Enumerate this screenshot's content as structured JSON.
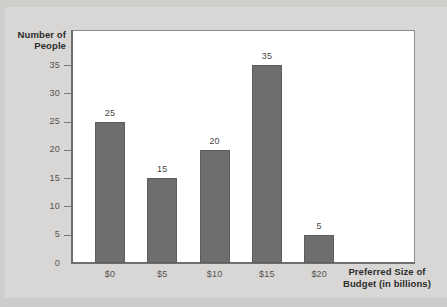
{
  "chart_data": {
    "type": "bar",
    "title": "",
    "xlabel": "Preferred Size of Budget (in billions)",
    "ylabel": "Number of People",
    "categories": [
      "$0",
      "$5",
      "$10",
      "$15",
      "$20"
    ],
    "values": [
      25,
      15,
      20,
      35,
      5
    ],
    "value_labels": [
      "25",
      "15",
      "20",
      "35",
      "5"
    ],
    "ylim": [
      0,
      35
    ],
    "yticks": [
      0,
      5,
      10,
      15,
      20,
      25,
      30,
      35
    ],
    "ytick_labels": [
      "0",
      "5",
      "10",
      "15",
      "20",
      "25",
      "30",
      "35"
    ],
    "grid": false,
    "legend": false,
    "bar_color": "#6e6e6e",
    "plot_background": "#ffffff",
    "figure_background": "#d8d7d5",
    "text_color": "#2e2d2b"
  },
  "axis_titles": {
    "y_line_1": "Number of",
    "y_line_2": "People",
    "x_line_1": "Preferred Size of",
    "x_line_2": "Budget (in billions)"
  }
}
